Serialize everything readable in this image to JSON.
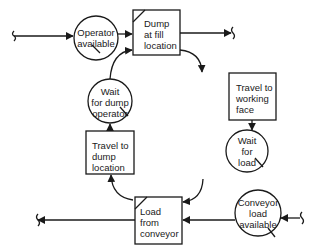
{
  "diagram": {
    "type": "activity-cycle",
    "colors": {
      "line": "#1a1a1a",
      "background": "#ffffff"
    },
    "queues": [
      {
        "id": "operator_available",
        "lines": [
          "Operator",
          "available"
        ]
      },
      {
        "id": "wait_for_dump_operator",
        "lines": [
          "Wait",
          "for dump",
          "operator"
        ]
      },
      {
        "id": "wait_for_load",
        "lines": [
          "Wait",
          "for",
          "load"
        ]
      },
      {
        "id": "conveyor_load_available",
        "lines": [
          "Conveyor",
          "load",
          "available"
        ]
      }
    ],
    "activities": [
      {
        "id": "dump_at_fill_location",
        "lines": [
          "Dump",
          "at fill",
          "location"
        ]
      },
      {
        "id": "travel_to_working_face",
        "lines": [
          "Travel to",
          "working",
          "face"
        ]
      },
      {
        "id": "travel_to_dump_location",
        "lines": [
          "Travel to",
          "dump",
          "location"
        ]
      },
      {
        "id": "load_from_conveyor",
        "lines": [
          "Load",
          "from",
          "conveyor"
        ]
      }
    ],
    "edges": [
      {
        "from": "source_left_top",
        "to": "operator_available"
      },
      {
        "from": "operator_available",
        "to": "dump_at_fill_location"
      },
      {
        "from": "wait_for_dump_operator",
        "to": "dump_at_fill_location"
      },
      {
        "from": "dump_at_fill_location",
        "to": "sink_right_top"
      },
      {
        "from": "dump_at_fill_location",
        "to": "travel_to_working_face"
      },
      {
        "from": "travel_to_working_face",
        "to": "wait_for_load"
      },
      {
        "from": "wait_for_load",
        "to": "load_from_conveyor"
      },
      {
        "from": "source_right_bottom",
        "to": "conveyor_load_available"
      },
      {
        "from": "conveyor_load_available",
        "to": "load_from_conveyor"
      },
      {
        "from": "load_from_conveyor",
        "to": "sink_left_bottom"
      },
      {
        "from": "load_from_conveyor",
        "to": "travel_to_dump_location"
      },
      {
        "from": "travel_to_dump_location",
        "to": "wait_for_dump_operator"
      }
    ]
  }
}
